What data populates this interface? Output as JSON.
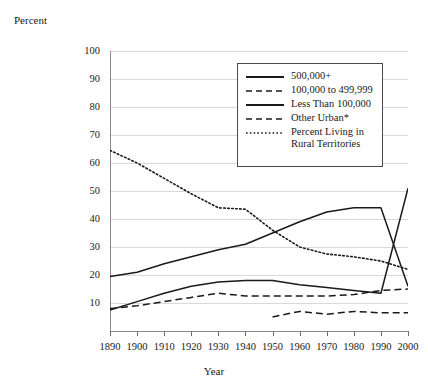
{
  "chart_data": {
    "type": "line",
    "title": "",
    "xlabel": "Year",
    "ylabel": "Percent",
    "xlim": [
      1890,
      2000
    ],
    "ylim": [
      0,
      100
    ],
    "grid": true,
    "legend_position": "upper-center-right",
    "x": [
      1890,
      1900,
      1910,
      1920,
      1930,
      1940,
      1950,
      1960,
      1970,
      1980,
      1990,
      2000
    ],
    "y_ticks": [
      0,
      10,
      20,
      30,
      40,
      50,
      60,
      70,
      80,
      90,
      100
    ],
    "x_ticks": [
      1890,
      1900,
      1910,
      1920,
      1930,
      1940,
      1950,
      1960,
      1970,
      1980,
      1990,
      2000
    ],
    "series": [
      {
        "name": "500,000+",
        "style": "solid",
        "x": [
          1890,
          1900,
          1910,
          1920,
          1930,
          1940,
          1950,
          1960,
          1970,
          1980,
          1990,
          2000
        ],
        "values": [
          7.5,
          10.5,
          13.5,
          16.0,
          17.5,
          18.0,
          18.0,
          16.5,
          15.5,
          14.5,
          13.5,
          51.0
        ]
      },
      {
        "name": "100,000 to 499,999",
        "style": "dashed",
        "x": [
          1890,
          1900,
          1910,
          1920,
          1930,
          1940,
          1950,
          1960,
          1970,
          1980,
          1990,
          2000
        ],
        "values": [
          8.0,
          9.0,
          10.5,
          12.0,
          13.5,
          12.5,
          12.5,
          12.5,
          12.5,
          13.0,
          14.5,
          15.0
        ]
      },
      {
        "name": "Less Than 100,000",
        "style": "solid",
        "x": [
          1890,
          1900,
          1910,
          1920,
          1930,
          1940,
          1950,
          1960,
          1970,
          1980,
          1990,
          2000
        ],
        "values": [
          19.5,
          21.0,
          24.0,
          26.5,
          29.0,
          31.0,
          35.0,
          39.0,
          42.5,
          44.0,
          44.0,
          16.0
        ]
      },
      {
        "name": "Other Urban*",
        "style": "dashed",
        "x": [
          1950,
          1960,
          1970,
          1980,
          1990,
          2000
        ],
        "values": [
          5.0,
          7.0,
          6.0,
          7.0,
          6.5,
          6.5
        ]
      },
      {
        "name": "Percent Living in Rural Territories",
        "style": "dotted",
        "x": [
          1890,
          1900,
          1910,
          1920,
          1930,
          1940,
          1950,
          1960,
          1970,
          1980,
          1990,
          2000
        ],
        "values": [
          64.5,
          60.0,
          54.5,
          49.0,
          44.0,
          43.5,
          36.0,
          30.0,
          27.5,
          26.5,
          25.0,
          22.0
        ]
      }
    ]
  },
  "axes": {
    "y_title": "Percent",
    "x_title": "Year",
    "y_tick_labels": [
      "100",
      "90",
      "80",
      "70",
      "60",
      "50",
      "40",
      "30",
      "20",
      "10"
    ],
    "x_tick_labels": [
      "1890",
      "1900",
      "1910",
      "1920",
      "1930",
      "1940",
      "1950",
      "1960",
      "1970",
      "1980",
      "1990",
      "2000"
    ]
  },
  "legend": {
    "items": [
      {
        "label": "500,000+",
        "style": "solid"
      },
      {
        "label": "100,000 to 499,999",
        "style": "dashed"
      },
      {
        "label": "Less Than 100,000",
        "style": "solid"
      },
      {
        "label": "Other Urban*",
        "style": "dashed"
      },
      {
        "label": "Percent Living in",
        "label2": "Rural Territories",
        "style": "dotted"
      }
    ]
  },
  "colors": {
    "line": "#1a1a1a",
    "grid": "#d9d9d9",
    "axis": "#8a8a8a",
    "background": "#ffffff"
  }
}
